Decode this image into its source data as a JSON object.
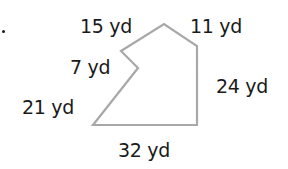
{
  "figure": {
    "type": "polygon-perimeter-diagram",
    "units": "yd",
    "stroke_color": "#a8a8a8",
    "text_color": "#1a1a1a",
    "problem_marker": ".",
    "vertices": [
      [
        93,
        125
      ],
      [
        138,
        68
      ],
      [
        121,
        51
      ],
      [
        164,
        24
      ],
      [
        197,
        46
      ],
      [
        197,
        125
      ]
    ],
    "side_labels": {
      "top_left": "15 yd",
      "top_right": "11 yd",
      "notch": "7 yd",
      "right": "24 yd",
      "lower_left": "21 yd",
      "bottom": "32 yd"
    }
  }
}
